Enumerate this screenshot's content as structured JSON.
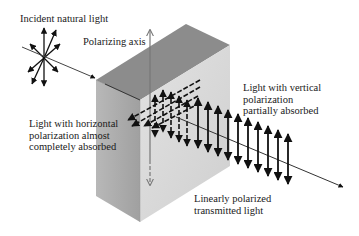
{
  "diagram": {
    "labels": {
      "incident": "Incident natural light",
      "axis": "Polarizing axis",
      "vertical": [
        "Light with vertical",
        "polarization",
        "partially absorbed"
      ],
      "horizontal": [
        "Light with horizontal",
        "polarization almost",
        "completely absorbed"
      ],
      "transmitted": [
        "Linearly polarized",
        "transmitted light"
      ]
    },
    "colors": {
      "top_face": "#8f8f8f",
      "left_face": "#a9a9a9",
      "front_face": "#d6d6d6",
      "arrow": "#111111",
      "axis_arrow": "#777777"
    }
  }
}
